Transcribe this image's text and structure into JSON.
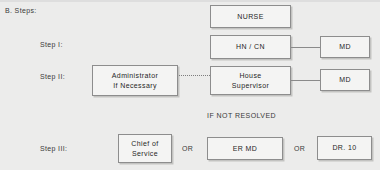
{
  "section": {
    "heading": "B. Steps:"
  },
  "steps": [
    {
      "label": "Step I:"
    },
    {
      "label": "Step II:"
    },
    {
      "label": "Step III:"
    }
  ],
  "nodes": {
    "nurse": "NURSE",
    "hn_cn": "HN / CN",
    "md_top": "MD",
    "md_bottom": "MD",
    "administrator_line1": "Administrator",
    "administrator_line2": "If Necessary",
    "house_supervisor_line1": "House",
    "house_supervisor_line2": "Supervisor",
    "chief_of_service_line1": "Chief of",
    "chief_of_service_line2": "Service",
    "er_md": "ER MD",
    "dr_10": "DR. 10"
  },
  "annotations": {
    "if_not_resolved": "IF NOT RESOLVED",
    "or_first": "OR",
    "or_second": "OR"
  },
  "colors": {
    "background": "#ececeb",
    "box_fill": "#f4f4f3",
    "box_border": "#8d8d8d",
    "text": "#2b2b2b",
    "connector": "#8a8a8a"
  }
}
